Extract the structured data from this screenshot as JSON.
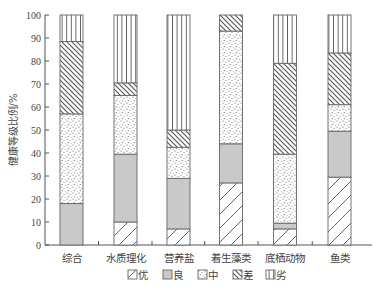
{
  "chart_data": {
    "type": "bar",
    "stacked": true,
    "title": "",
    "xlabel": "",
    "ylabel": "健康等级比例/%",
    "ylim": [
      0,
      100
    ],
    "yticks": [
      0,
      10,
      20,
      30,
      40,
      50,
      60,
      70,
      80,
      90,
      100
    ],
    "grid": false,
    "legend_position": "bottom",
    "categories": [
      "综合",
      "水质理化",
      "营养盐",
      "着生藻类",
      "底栖动物",
      "鱼类"
    ],
    "series": [
      {
        "name": "优",
        "pattern": "diagonal-up",
        "values": [
          0,
          10,
          7,
          27,
          7,
          29.5
        ]
      },
      {
        "name": "良",
        "pattern": "solid-gray",
        "values": [
          18,
          29.5,
          22,
          17,
          2.5,
          20
        ]
      },
      {
        "name": "中",
        "pattern": "dots",
        "values": [
          39,
          25.5,
          13.5,
          49,
          30,
          11.5
        ]
      },
      {
        "name": "差",
        "pattern": "diagonal-down",
        "values": [
          31.5,
          5.5,
          7.5,
          7,
          39.5,
          22.5
        ]
      },
      {
        "name": "劣",
        "pattern": "vertical-lines",
        "values": [
          11.5,
          29.5,
          50,
          0,
          21,
          16.5
        ]
      }
    ]
  },
  "colors": {
    "axis": "#555555",
    "bar_outline": "#666666",
    "gray_fill": "#c8c8c8",
    "hatch": "#555555"
  }
}
